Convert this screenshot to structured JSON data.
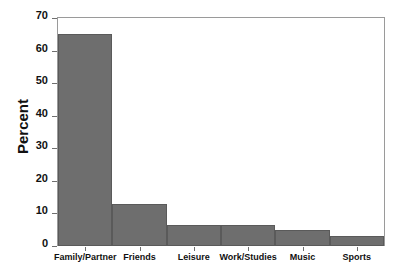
{
  "chart_data": {
    "type": "bar",
    "title": "",
    "subtitle": "",
    "xlabel": "",
    "ylabel": "Percent",
    "categories": [
      "Family/Partner",
      "Friends",
      "Leisure",
      "Work/Studies",
      "Music",
      "Sports"
    ],
    "values": [
      65.0,
      12.8,
      6.6,
      6.6,
      4.8,
      3.2
    ],
    "ylim": [
      0,
      70
    ],
    "ytick_labels": [
      "0",
      "10",
      "20",
      "30",
      "40",
      "50",
      "60",
      "70"
    ],
    "ytick_values": [
      0,
      10,
      20,
      30,
      40,
      50,
      60,
      70
    ],
    "grid": false,
    "legend": null,
    "legend_position": "none",
    "bar_color": "#6e6e6e",
    "bar_edge_color": "#5a5a5a",
    "axis_color": "#9a9a9a",
    "text_color": "#111111",
    "background": "#ffffff",
    "annotations": []
  }
}
